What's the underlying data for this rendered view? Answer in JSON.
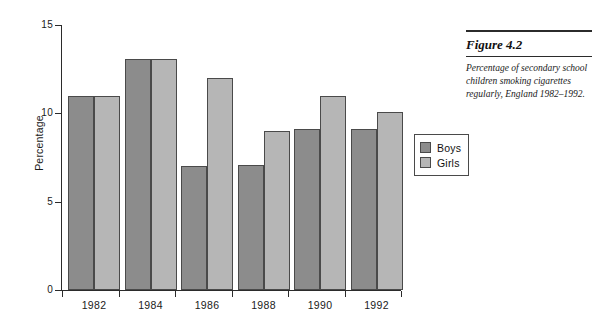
{
  "caption": {
    "title": "Figure 4.2",
    "text": "Percentage of secondary school children smoking cigarettes regularly, England 1982–1992."
  },
  "legend": {
    "items": [
      {
        "label": "Boys",
        "color": "#8c8c8c"
      },
      {
        "label": "Girls",
        "color": "#b6b6b6"
      }
    ]
  },
  "chart_data": {
    "type": "bar",
    "title": "",
    "xlabel": "",
    "ylabel": "Percentage",
    "categories": [
      "1982",
      "1984",
      "1986",
      "1988",
      "1990",
      "1992"
    ],
    "series": [
      {
        "name": "Boys",
        "color": "#8c8c8c",
        "values": [
          11,
          13.1,
          7,
          7.1,
          9.1,
          9.1
        ]
      },
      {
        "name": "Girls",
        "color": "#b6b6b6",
        "values": [
          11,
          13.1,
          12,
          9,
          11,
          10.1
        ]
      }
    ],
    "ylim": [
      0,
      15
    ],
    "yticks": [
      0,
      5,
      10,
      15
    ],
    "ytick_labels": [
      "0",
      "5",
      "10",
      "15"
    ],
    "grid": false,
    "legend_position": "right-outside"
  }
}
